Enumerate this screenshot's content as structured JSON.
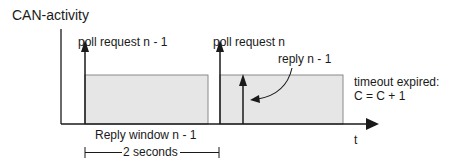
{
  "diagram": {
    "y_axis_label": "CAN-activity",
    "x_axis_label": "t",
    "events": [
      {
        "label": "poll request n - 1"
      },
      {
        "label": "poll request n"
      },
      {
        "label": "reply n - 1"
      }
    ],
    "annotation": {
      "line1": "timeout expired:",
      "line2": "C = C + 1"
    },
    "window_label": "Reply window n - 1",
    "duration_label": "2 seconds"
  },
  "colors": {
    "line": "#1a1a1a",
    "window_fill": "#e6e6e6",
    "window_stroke": "#8a8a8a"
  }
}
